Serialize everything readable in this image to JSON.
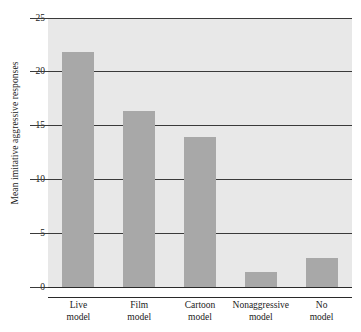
{
  "chart_data": {
    "type": "bar",
    "title": "",
    "subtitle": "",
    "xlabel": "",
    "ylabel": "Mean imitative aggressive responses",
    "categories": [
      "Live model",
      "Film model",
      "Cartoon model",
      "Nonaggressive model",
      "No model"
    ],
    "category_lines": [
      [
        "Live",
        "model"
      ],
      [
        "Film",
        "model"
      ],
      [
        "Cartoon",
        "model"
      ],
      [
        "Nonaggressive",
        "model"
      ],
      [
        "No",
        "model"
      ]
    ],
    "values": [
      21.8,
      16.4,
      13.9,
      1.4,
      2.7
    ],
    "ylim": [
      0,
      25
    ],
    "yticks": [
      0,
      5,
      10,
      15,
      20,
      25
    ],
    "ytick_labels": [
      "0",
      "5",
      "10",
      "15",
      "20",
      "25"
    ],
    "grid": true,
    "grid_axis": "y",
    "legend": false,
    "legend_position": "none",
    "bar_color": "#a8a8a8",
    "plot_background": "#e8e8e8",
    "gridline_color": "#3a3a3a",
    "axis_color": "#2a2a2a",
    "text_color": "#1a1a1a"
  }
}
